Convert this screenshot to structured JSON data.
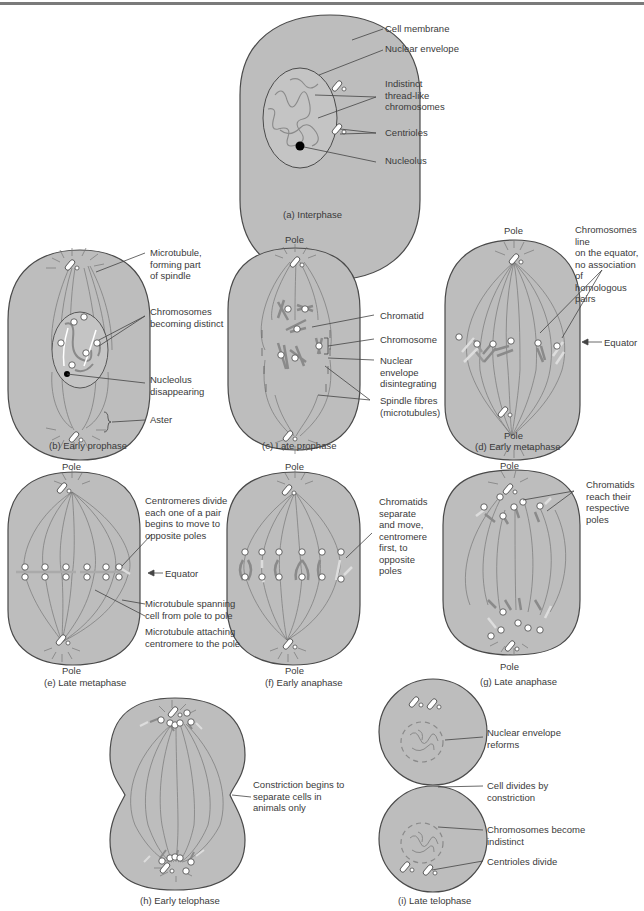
{
  "colors": {
    "cell_fill": "#bdbdbd",
    "cell_stroke": "#4a4a4a",
    "line": "#444444",
    "chromosome": "#8a8a8a",
    "top_bar": "#7a7a7a"
  },
  "common": {
    "pole": "Pole",
    "equator": "Equator"
  },
  "panels": {
    "a": {
      "caption": "(a) Interphase",
      "labels": [
        "Cell membrane",
        "Nuclear envelope",
        "Indistinct\nthread-like\nchromosomes",
        "Centrioles",
        "Nucleolus"
      ]
    },
    "b": {
      "caption": "(b) Early prophase",
      "labels": [
        "Microtubule,\nforming part\nof spindle",
        "Chromosomes\nbecoming distinct",
        "Nucleolus\ndisappearing",
        "Aster"
      ]
    },
    "c": {
      "caption": "(c) Late prophase",
      "labels": [
        "Chromatid",
        "Chromosome",
        "Nuclear\nenvelope\ndisintegrating",
        "Spindle fibres\n(microtubules)"
      ]
    },
    "d": {
      "caption": "(d) Early metaphase",
      "labels": [
        "Chromosomes line\non the equator,\nno association of\nhomologous pairs"
      ]
    },
    "e": {
      "caption": "(e) Late metaphase",
      "labels": [
        "Centromeres divide\neach one of a pair\nbegins to move to\nopposite poles",
        "Microtubule spanning\ncell from pole to pole",
        "Microtubule attaching\ncentromere to the pole"
      ]
    },
    "f": {
      "caption": "(f) Early anaphase",
      "labels": [
        "Chromatids\nseparate\nand move,\ncentromere\nfirst, to\nopposite\npoles"
      ]
    },
    "g": {
      "caption": "(g) Late anaphase",
      "labels": [
        "Chromatids\nreach their\nrespective\npoles"
      ]
    },
    "h": {
      "caption": "(h) Early telophase",
      "labels": [
        "Constriction begins to\nseparate cells in\nanimals only"
      ]
    },
    "i": {
      "caption": "(i) Late telophase",
      "labels": [
        "Nuclear envelope\nreforms",
        "Cell divides by\nconstriction",
        "Chromosomes become\nindistinct",
        "Centrioles divide"
      ]
    }
  }
}
